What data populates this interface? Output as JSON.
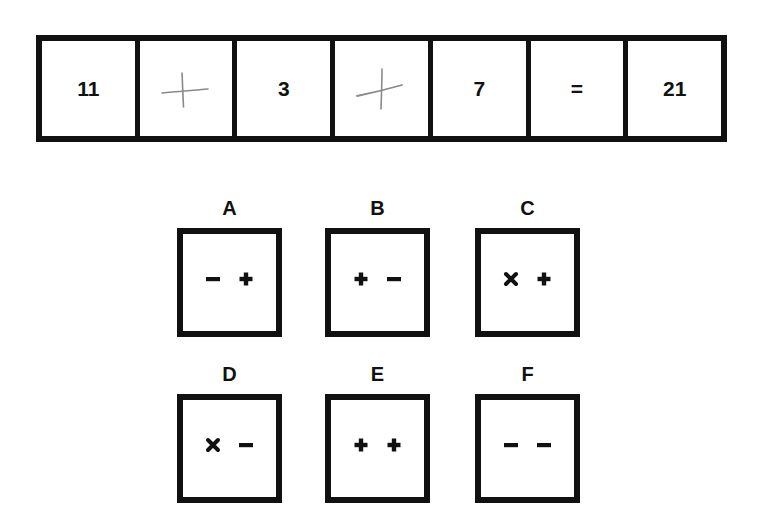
{
  "puzzle": {
    "equation": [
      {
        "type": "number",
        "value": "11"
      },
      {
        "type": "blank",
        "handwritten": "plus"
      },
      {
        "type": "number",
        "value": "3"
      },
      {
        "type": "blank",
        "handwritten": "plus"
      },
      {
        "type": "number",
        "value": "7"
      },
      {
        "type": "operator",
        "value": "="
      },
      {
        "type": "number",
        "value": "21"
      }
    ],
    "options": [
      {
        "label": "A",
        "symbols": [
          "minus",
          "plus"
        ]
      },
      {
        "label": "B",
        "symbols": [
          "plus",
          "minus"
        ]
      },
      {
        "label": "C",
        "symbols": [
          "times",
          "plus"
        ]
      },
      {
        "label": "D",
        "symbols": [
          "times",
          "minus"
        ]
      },
      {
        "label": "E",
        "symbols": [
          "plus",
          "plus"
        ]
      },
      {
        "label": "F",
        "symbols": [
          "minus",
          "minus"
        ]
      }
    ]
  },
  "colors": {
    "ink": "#111111",
    "pencil": "#8a8a8a",
    "background": "#ffffff"
  }
}
